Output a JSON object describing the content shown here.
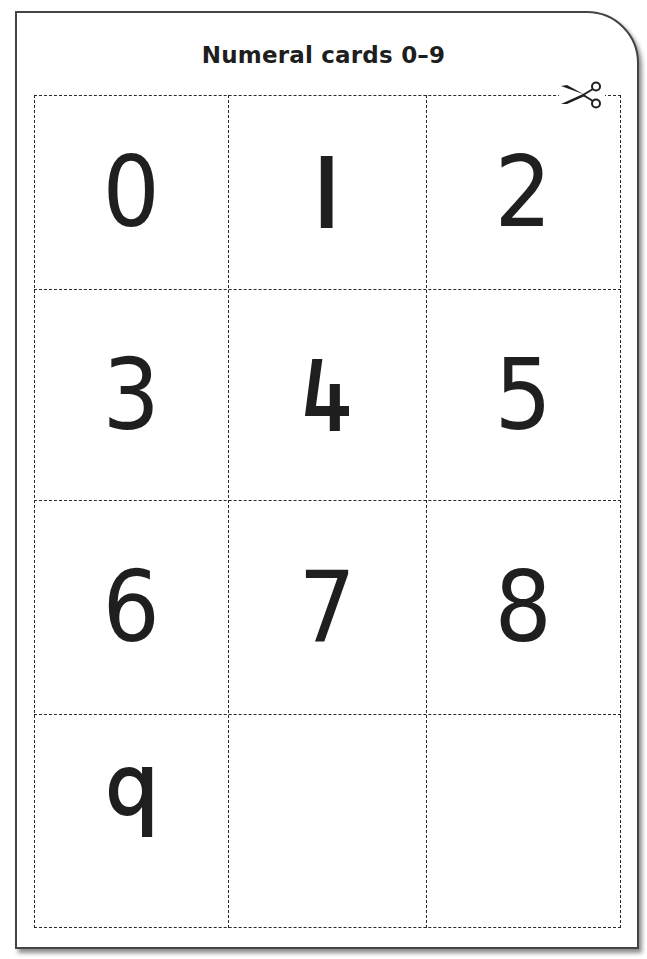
{
  "title": "Numeral cards 0–9",
  "colors": {
    "ink": "#1f1f1f",
    "border": "#444444",
    "background": "#ffffff"
  },
  "grid": {
    "columns": 3,
    "rows": 4
  },
  "cards": [
    {
      "label": "0",
      "row": 0,
      "col": 0
    },
    {
      "label": "1",
      "row": 0,
      "col": 1
    },
    {
      "label": "2",
      "row": 0,
      "col": 2
    },
    {
      "label": "3",
      "row": 1,
      "col": 0
    },
    {
      "label": "4",
      "row": 1,
      "col": 1
    },
    {
      "label": "5",
      "row": 1,
      "col": 2
    },
    {
      "label": "6",
      "row": 2,
      "col": 0
    },
    {
      "label": "7",
      "row": 2,
      "col": 1
    },
    {
      "label": "8",
      "row": 2,
      "col": 2
    },
    {
      "label": "9",
      "row": 3,
      "col": 0
    },
    {
      "label": "",
      "row": 3,
      "col": 1
    },
    {
      "label": "",
      "row": 3,
      "col": 2
    }
  ],
  "icons": {
    "cut_marker": "scissors-icon"
  }
}
